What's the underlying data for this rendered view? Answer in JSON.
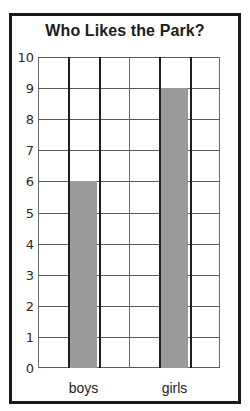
{
  "chart_data": {
    "type": "bar",
    "title": "Who Likes the Park?",
    "categories": [
      "boys",
      "girls"
    ],
    "values": [
      6,
      9
    ],
    "series": [
      {
        "name": "count",
        "values": [
          6,
          9
        ]
      }
    ],
    "xlabel": "",
    "ylabel": "",
    "ylim": [
      0,
      10
    ],
    "ytick_labels": [
      "0",
      "1",
      "2",
      "3",
      "4",
      "5",
      "6",
      "7",
      "8",
      "9",
      "10"
    ],
    "ytick_values": [
      0,
      1,
      2,
      3,
      4,
      5,
      6,
      7,
      8,
      9,
      10
    ],
    "grid": true,
    "legend": null,
    "columns": 6,
    "bar_columns": [
      2,
      5
    ],
    "colors": {
      "bar_fill": "#9a9a9a",
      "grid_line": "#6e6e6e",
      "heavy_line": "#1f1f1f",
      "frame": "#1a1a1a",
      "text": "#1c1c1c",
      "background": "#ffffff"
    }
  }
}
